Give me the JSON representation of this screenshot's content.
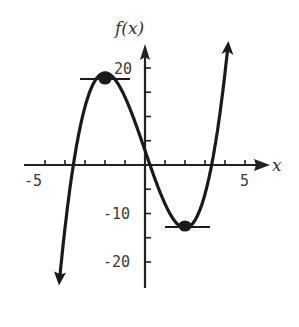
{
  "chart_data": {
    "type": "line",
    "title": "",
    "xlabel": "x",
    "ylabel": "f(x)",
    "function_estimate": "f(x) = x^3 - 12x + 3",
    "xlim": [
      -5,
      5
    ],
    "ylim": [
      -25,
      25
    ],
    "x_ticks": [
      -5,
      -4,
      -3,
      -2,
      -1,
      0,
      1,
      2,
      3,
      4,
      5
    ],
    "x_tick_labels": [
      "-5",
      "5"
    ],
    "y_ticks": [
      -20,
      -15,
      -10,
      -5,
      0,
      5,
      10,
      15,
      20
    ],
    "y_tick_labels": [
      "20",
      "-10",
      "-20"
    ],
    "grid": false,
    "series": [
      {
        "name": "f(x)",
        "x": [
          -4.3,
          -4,
          -3.5,
          -3,
          -2.5,
          -2,
          -1.5,
          -1,
          -0.5,
          0,
          0.5,
          1,
          1.5,
          2,
          2.5,
          3,
          3.5,
          4,
          4.3
        ],
        "y": [
          -25,
          -13,
          2,
          12,
          17,
          19,
          17,
          14,
          9,
          3,
          -3,
          -8,
          -12,
          -13,
          -11,
          -6,
          3,
          19,
          26
        ]
      }
    ],
    "annotations": [
      {
        "type": "local-maximum",
        "x": -2,
        "y": 19,
        "tangent": "horizontal"
      },
      {
        "type": "local-minimum",
        "x": 2,
        "y": -13,
        "tangent": "horizontal"
      }
    ]
  },
  "labels": {
    "y_axis_title": "f(x)",
    "x_axis_title": "x",
    "x_neg5": "-5",
    "x_pos5": "5",
    "y_20": "20",
    "y_neg10": "-10",
    "y_neg20": "-20"
  }
}
